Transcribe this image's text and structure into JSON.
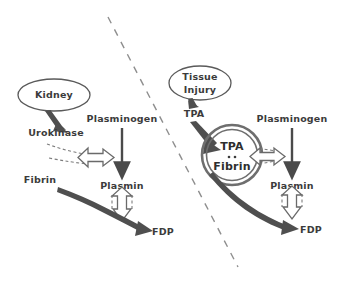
{
  "figure": {
    "background_color": "#ffffff",
    "ink_color": "#4a4a4a"
  },
  "divider": {
    "name": "dashed-divider-line",
    "style": "dashed",
    "color": "#8e8e8e",
    "from": {
      "x": 108,
      "y": 17
    },
    "to": {
      "x": 238,
      "y": 267
    }
  },
  "panels": [
    {
      "id": "left",
      "name": "urokinase-pathway-panel",
      "nodes": [
        {
          "id": "kidney",
          "label": "Kidney",
          "shape": "ellipse",
          "cx": 54,
          "cy": 95,
          "rx": 36,
          "ry": 16
        },
        {
          "id": "urokinase",
          "label": "Urokinase",
          "shape": "text",
          "cx": 56,
          "cy": 133
        },
        {
          "id": "plasminogen",
          "label": "Plasminogen",
          "shape": "text",
          "cx": 122,
          "cy": 119
        },
        {
          "id": "plasmin",
          "label": "Plasmin",
          "shape": "text",
          "cx": 122,
          "cy": 186
        },
        {
          "id": "fibrin",
          "label": "Fibrin",
          "shape": "text",
          "cx": 40,
          "cy": 180
        },
        {
          "id": "fdp",
          "label": "FDP",
          "shape": "text",
          "cx": 163,
          "cy": 232
        }
      ],
      "edges": [
        {
          "id": "kidney-to-urokinase",
          "from": "kidney",
          "to": "urokinase",
          "style": "solid-tapered-arrow"
        },
        {
          "id": "urokinase-activates-plasminogen",
          "from": "urokinase",
          "to": "plasminogen-arrow",
          "style": "hollow-dashed-arrow"
        },
        {
          "id": "plasminogen-to-plasmin",
          "from": "plasminogen",
          "to": "plasmin",
          "style": "solid-arrow"
        },
        {
          "id": "plasmin-cleaves-fibrin",
          "from": "plasmin",
          "to": "fibrin-to-fdp-arrow",
          "style": "hollow-dashed-arrow"
        },
        {
          "id": "fibrin-to-fdp",
          "from": "fibrin",
          "to": "fdp",
          "style": "thick-curved-arrow"
        }
      ]
    },
    {
      "id": "right",
      "name": "tpa-pathway-panel",
      "nodes": [
        {
          "id": "tissue-injury",
          "label_line1": "Tissue",
          "label_line2": "Injury",
          "shape": "ellipse",
          "cx": 200,
          "cy": 83,
          "rx": 31,
          "ry": 17
        },
        {
          "id": "tpa",
          "label": "TPA",
          "shape": "text",
          "cx": 194,
          "cy": 114
        },
        {
          "id": "tpa-fibrin-complex",
          "label_line1": "TPA",
          "label_line2": "Fibrin",
          "separator": "··",
          "shape": "double-ring-circle",
          "cx": 232,
          "cy": 155,
          "r": 30
        },
        {
          "id": "plasminogen",
          "label": "Plasminogen",
          "shape": "text",
          "cx": 292,
          "cy": 119
        },
        {
          "id": "plasmin",
          "label": "Plasmin",
          "shape": "text",
          "cx": 292,
          "cy": 186
        },
        {
          "id": "fdp",
          "label": "FDP",
          "shape": "text",
          "cx": 311,
          "cy": 230
        }
      ],
      "edges": [
        {
          "id": "tissue-injury-to-tpa",
          "from": "tissue-injury",
          "to": "tpa",
          "style": "solid-tapered-arrow"
        },
        {
          "id": "tpa-binds-fibrin",
          "from": "tpa",
          "to": "tpa-fibrin-complex",
          "style": "thick-tapered-arrow"
        },
        {
          "id": "complex-activates-plasminogen",
          "from": "tpa-fibrin-complex",
          "to": "plasminogen-arrow",
          "style": "hollow-dashed-arrow"
        },
        {
          "id": "plasminogen-to-plasmin",
          "from": "plasminogen",
          "to": "plasmin",
          "style": "solid-arrow"
        },
        {
          "id": "plasmin-cleaves-fibrin",
          "from": "plasmin",
          "to": "fibrin-to-fdp-arrow",
          "style": "hollow-dashed-arrow"
        },
        {
          "id": "complex-to-fdp",
          "from": "tpa-fibrin-complex",
          "to": "fdp",
          "style": "thick-curved-arrow"
        }
      ]
    }
  ]
}
